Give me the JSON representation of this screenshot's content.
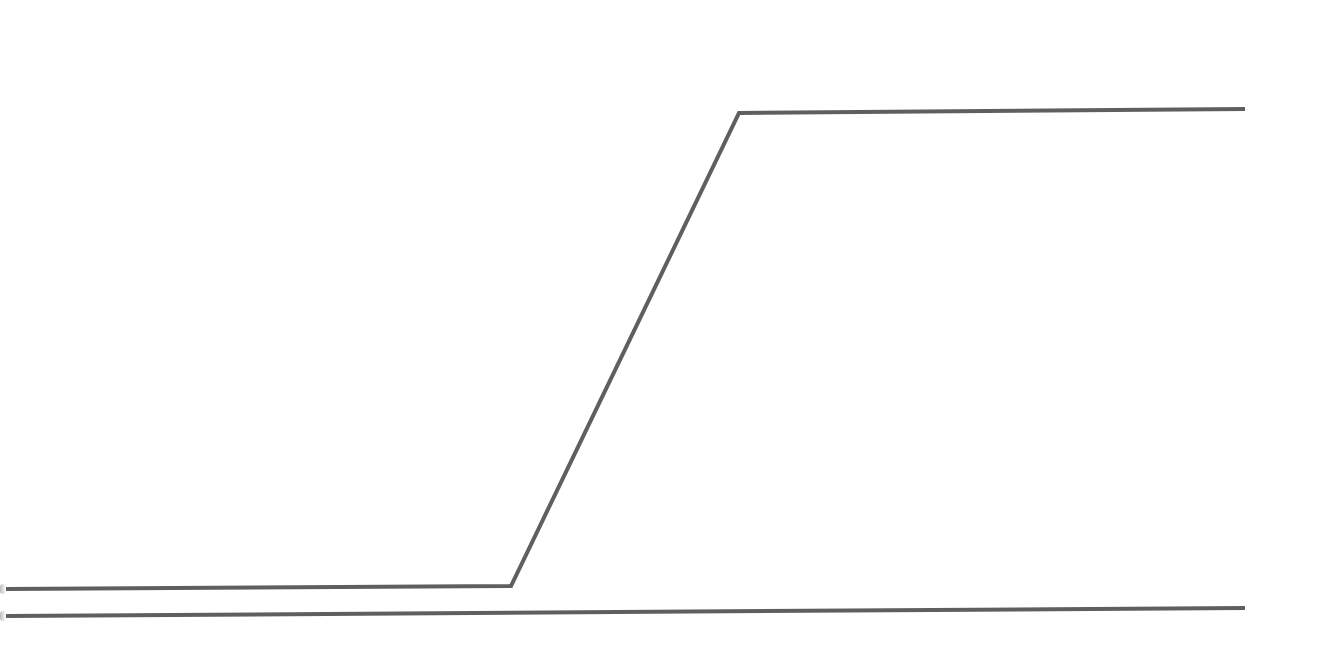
{
  "diagram": {
    "width": 1323,
    "height": 666,
    "background": "#ffffff",
    "stroke_color": "#5f5f5f",
    "stroke_width": 4,
    "lines": [
      {
        "name": "signal-trace-upper",
        "points": [
          [
            6,
            589
          ],
          [
            511,
            586
          ],
          [
            739,
            113
          ],
          [
            1245,
            109
          ]
        ]
      },
      {
        "name": "signal-trace-lower",
        "points": [
          [
            6,
            616
          ],
          [
            1245,
            608
          ]
        ]
      }
    ]
  }
}
